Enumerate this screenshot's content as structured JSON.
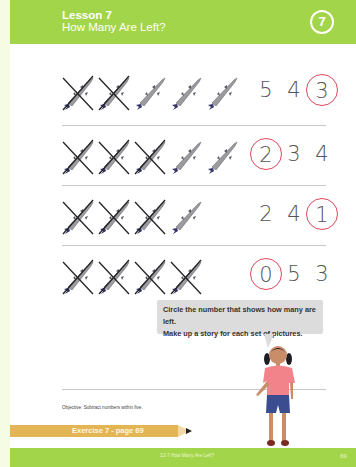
{
  "header": {
    "lesson_label": "Lesson 7",
    "lesson_title": "How Many Are Left?",
    "lesson_number": "7"
  },
  "rows": [
    {
      "total_fish": 5,
      "crossed": 2,
      "numbers": [
        "5",
        "4",
        "3"
      ],
      "circled_index": 2
    },
    {
      "total_fish": 5,
      "crossed": 3,
      "numbers": [
        "2",
        "3",
        "4"
      ],
      "circled_index": 0
    },
    {
      "total_fish": 4,
      "crossed": 3,
      "numbers": [
        "2",
        "4",
        "1"
      ],
      "circled_index": 2
    },
    {
      "total_fish": 4,
      "crossed": 4,
      "numbers": [
        "0",
        "5",
        "3"
      ],
      "circled_index": 0
    }
  ],
  "speech": {
    "line1": "Circle the number that shows how many are left.",
    "line2": "Make up a story for each set of pictures."
  },
  "objective": "Objective: Subtract numbers within five.",
  "exercise": "Exercise 7 - page 69",
  "footer": {
    "title": "12-7  How Many Are Left?",
    "page": "69"
  },
  "colors": {
    "accent_green": "#a3d54a",
    "circle_red": "#e0475b",
    "pencil_yellow": "#e3b554"
  }
}
